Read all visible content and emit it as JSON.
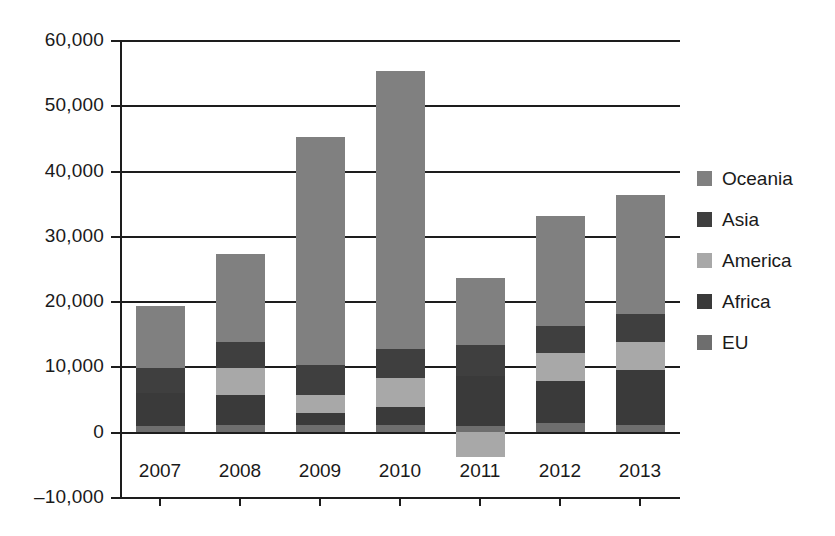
{
  "chart_data": {
    "type": "bar",
    "subtype": "stacked-bar",
    "title": "",
    "subtitle": "",
    "xlabel": "",
    "ylabel": "",
    "categories": [
      "2007",
      "2008",
      "2009",
      "2010",
      "2011",
      "2012",
      "2013"
    ],
    "ylim": [
      -10000,
      60000
    ],
    "ytick_values": [
      60000,
      50000,
      40000,
      30000,
      20000,
      10000,
      0,
      -10000
    ],
    "ytick_labels": [
      "60,000",
      "50,000",
      "40,000",
      "30,000",
      "20,000",
      "10,000",
      "0",
      "–10,000"
    ],
    "grid": true,
    "grid_axis": "y",
    "legend_position": "right",
    "legend_order": [
      "Oceania",
      "Asia",
      "America",
      "Africa",
      "EU"
    ],
    "stack_order_bottom_to_top": [
      "EU",
      "Africa",
      "America",
      "Asia",
      "Oceania"
    ],
    "series": [
      {
        "name": "EU",
        "color": "#6e6e6e",
        "values": [
          900,
          1100,
          1000,
          1000,
          900,
          1300,
          1000
        ]
      },
      {
        "name": "Africa",
        "color": "#3a3a3a",
        "values": [
          5000,
          4500,
          1800,
          2800,
          7700,
          6500,
          8400
        ]
      },
      {
        "name": "America",
        "color": "#a8a8a8",
        "values": [
          0,
          4200,
          2800,
          4400,
          -3800,
          4300,
          4400
        ]
      },
      {
        "name": "Asia",
        "color": "#3f3f3f",
        "values": [
          3800,
          3900,
          4600,
          4500,
          4700,
          4100,
          4300
        ]
      },
      {
        "name": "Oceania",
        "color": "#808080",
        "values": [
          9500,
          13500,
          35000,
          42500,
          10200,
          16900,
          18200
        ]
      }
    ],
    "totals_positive": [
      19200,
      27200,
      45200,
      55200,
      23500,
      33100,
      36300
    ],
    "totals_negative": [
      0,
      0,
      0,
      0,
      -3800,
      0,
      0
    ]
  },
  "legend": {
    "items": [
      {
        "label": "Oceania",
        "color": "#808080"
      },
      {
        "label": "Asia",
        "color": "#3f3f3f"
      },
      {
        "label": "America",
        "color": "#a8a8a8"
      },
      {
        "label": "Africa",
        "color": "#3a3a3a"
      },
      {
        "label": "EU",
        "color": "#6e6e6e"
      }
    ]
  },
  "axis": {
    "y_labels": [
      "60,000",
      "50,000",
      "40,000",
      "30,000",
      "20,000",
      "10,000",
      "0",
      "–10,000"
    ],
    "x_labels": [
      "2007",
      "2008",
      "2009",
      "2010",
      "2011",
      "2012",
      "2013"
    ]
  },
  "colors": {
    "axis": "#1d1d1d",
    "text": "#1a1a1a",
    "background": "#ffffff"
  }
}
